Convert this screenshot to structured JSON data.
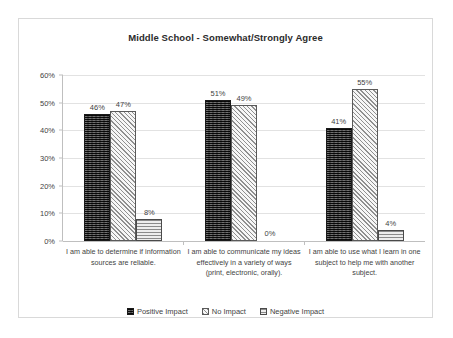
{
  "chart_data": {
    "type": "bar",
    "title": "Middle School - Somewhat/Strongly Agree",
    "xlabel": "",
    "ylabel": "",
    "ylim": [
      0,
      60
    ],
    "ytick_labels": [
      "0%",
      "10%",
      "20%",
      "30%",
      "40%",
      "50%",
      "60%"
    ],
    "ytick_values": [
      0,
      10,
      20,
      30,
      40,
      50,
      60
    ],
    "grid": true,
    "legend_position": "bottom",
    "categories": [
      "I am able to determine if information sources are reliable.",
      "I am able to communicate my ideas effectively in a variety of ways (print, electronic, orally).",
      "I am able to use what I learn in one subject to help me with another subject."
    ],
    "series": [
      {
        "name": "Positive Impact",
        "values": [
          46,
          51,
          41
        ],
        "labels": [
          "46%",
          "47%",
          "41%"
        ],
        "color": "#3a3a3a"
      },
      {
        "name": "No Impact",
        "values": [
          47,
          49,
          55
        ],
        "labels": [
          "47%",
          "49%",
          "55%"
        ],
        "color": "#f2f2f2"
      },
      {
        "name": "Negative Impact",
        "values": [
          8,
          0,
          4
        ],
        "labels": [
          "8%",
          "0%",
          "4%"
        ],
        "color": "#e6e6e6"
      }
    ],
    "data_labels": [
      [
        "46%",
        "47%",
        "8%"
      ],
      [
        "51%",
        "49%",
        "0%"
      ],
      [
        "41%",
        "55%",
        "4%"
      ]
    ]
  }
}
